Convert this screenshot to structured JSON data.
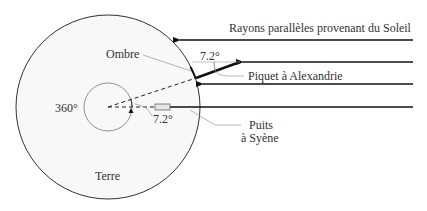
{
  "title_label": "Rayons parallèles provenant du Soleil",
  "labels": {
    "shadow": "Ombre",
    "stick_angle": "7.2°",
    "stick": "Piquet à Alexandrie",
    "full_circle": "360°",
    "center_angle": "7.2°",
    "well_line1": "Puits",
    "well_line2": "à Syène",
    "earth": "Terre"
  },
  "colors": {
    "background": "#ffffff",
    "earth_fill": "#f8f8f8",
    "stroke": "#222222",
    "leader": "#888888",
    "well_fill": "#e6e6e6"
  },
  "icons": {
    "ray_arrow": "arrow-left-icon"
  }
}
